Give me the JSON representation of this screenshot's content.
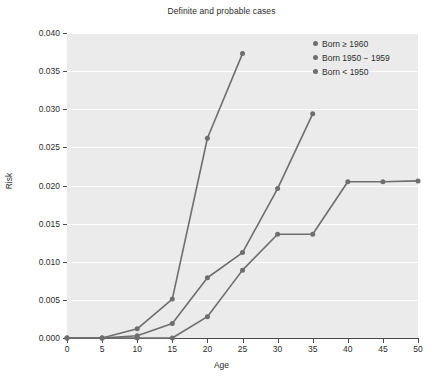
{
  "chart_data": {
    "type": "line",
    "title": "Definite and probable cases",
    "xlabel": "Age",
    "ylabel": "Risk",
    "xlim": [
      0,
      50
    ],
    "ylim": [
      0.0,
      0.04
    ],
    "xticks": [
      0,
      5,
      10,
      15,
      20,
      25,
      30,
      35,
      40,
      45,
      50
    ],
    "xtick_labels": [
      "0",
      "5",
      "10",
      "15",
      "20",
      "25",
      "30",
      "35",
      "40",
      "45",
      "50"
    ],
    "yticks": [
      0.0,
      0.005,
      0.01,
      0.015,
      0.02,
      0.025,
      0.03,
      0.035,
      0.04
    ],
    "ytick_labels": [
      "0.000",
      "0.005",
      "0.010",
      "0.015",
      "0.020",
      "0.025",
      "0.030",
      "0.035",
      "0.040"
    ],
    "grid": true,
    "grid_color": "#ffffff",
    "plot_background": "#ebebeb",
    "legend_position": "top-right",
    "marker": "circle",
    "series": [
      {
        "name": "Born ≥ 1960",
        "color": "#6e6e6e",
        "x": [
          0,
          5,
          10,
          15,
          20,
          25
        ],
        "values": [
          0.0,
          0.0,
          0.0012,
          0.0051,
          0.0262,
          0.0373
        ]
      },
      {
        "name": "Born 1950 − 1959",
        "color": "#6e6e6e",
        "x": [
          0,
          5,
          10,
          15,
          20,
          25,
          30,
          35
        ],
        "values": [
          0.0,
          0.0,
          0.0003,
          0.0019,
          0.0079,
          0.0112,
          0.0196,
          0.0294
        ]
      },
      {
        "name": "Born < 1950",
        "color": "#6e6e6e",
        "x": [
          0,
          5,
          10,
          15,
          20,
          25,
          30,
          35,
          40,
          45,
          50
        ],
        "values": [
          0.0,
          0.0,
          0.0,
          0.0,
          0.0028,
          0.0089,
          0.0136,
          0.0136,
          0.0205,
          0.0205,
          0.0206
        ]
      }
    ]
  },
  "legend": {
    "items": [
      {
        "label": "Born ≥ 1960",
        "color": "#6e6e6e"
      },
      {
        "label": "Born 1950 − 1959",
        "color": "#6e6e6e"
      },
      {
        "label": "Born < 1950",
        "color": "#6e6e6e"
      }
    ]
  }
}
